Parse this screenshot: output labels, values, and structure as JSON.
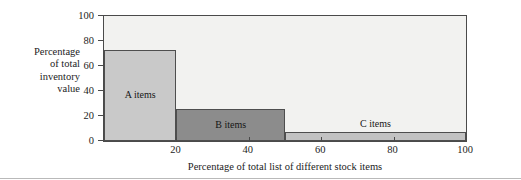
{
  "chart_data": {
    "type": "bar",
    "title": "",
    "subtitle": "",
    "xlabel": "Percentage of total list of different stock items",
    "ylabel": "Percentage of total inventory value",
    "ylabel_lines": [
      "Percentage",
      "of total",
      "inventory",
      "value"
    ],
    "xlim": [
      0,
      100
    ],
    "ylim": [
      0,
      100
    ],
    "grid": false,
    "legend": "none",
    "xticks": [
      20,
      40,
      60,
      80,
      100
    ],
    "xtick_labels": [
      "20",
      "40",
      "60",
      "80",
      "100"
    ],
    "yticks": [
      0,
      20,
      40,
      60,
      80,
      100
    ],
    "ytick_labels": [
      "0",
      "20",
      "40",
      "60",
      "80",
      "100"
    ],
    "orientation": "vertical",
    "bar_style": "stepped-pareto",
    "categories": [
      "A items",
      "B items",
      "C items"
    ],
    "values": [
      73,
      26,
      7
    ],
    "bars": [
      {
        "label": "A items",
        "x_start": 0,
        "x_end": 20,
        "value": 73,
        "color": "#c9c9c9",
        "edge_color": "#4e4e4e"
      },
      {
        "label": "B items",
        "x_start": 20,
        "x_end": 50,
        "value": 26,
        "color": "#8c8c8c",
        "edge_color": "#4e4e4e"
      },
      {
        "label": "C items",
        "x_start": 50,
        "x_end": 100,
        "value": 7,
        "color": "#c2c2c2",
        "edge_color": "#4e4e4e"
      }
    ],
    "colors": {
      "plot_background": "#f2f2f0",
      "axis": "#4a4a4a",
      "text": "#1c1c1c",
      "a_items": "#c9c9c9",
      "b_items": "#8c8c8c",
      "c_items": "#c2c2c2"
    }
  }
}
